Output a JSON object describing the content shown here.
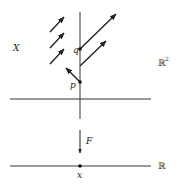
{
  "diagram": {
    "labels": {
      "space_X": "X",
      "plane": "ℝ",
      "plane_exponent": "2",
      "point_q": "q",
      "point_p": "p",
      "map": "F",
      "line": "ℝ",
      "point_x": "x"
    },
    "colors": {
      "stroke": "#222222",
      "background": "#ffffff"
    }
  }
}
